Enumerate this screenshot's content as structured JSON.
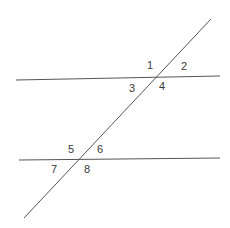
{
  "diagram": {
    "colors": {
      "line": "#555555",
      "label": "#3a3a3a",
      "background": "#ffffff"
    },
    "lines": [
      {
        "id": "parallel-line-top",
        "x1": 16,
        "y1": 80,
        "x2": 220,
        "y2": 76
      },
      {
        "id": "parallel-line-bottom",
        "x1": 19,
        "y1": 160,
        "x2": 220,
        "y2": 158
      },
      {
        "id": "transversal",
        "x1": 211,
        "y1": 19,
        "x2": 24,
        "y2": 218
      }
    ],
    "angle_labels": [
      {
        "text": "1",
        "x": 147,
        "y": 69
      },
      {
        "text": "2",
        "x": 181,
        "y": 70
      },
      {
        "text": "3",
        "x": 129,
        "y": 92
      },
      {
        "text": "4",
        "x": 159,
        "y": 90
      },
      {
        "text": "5",
        "x": 68,
        "y": 153
      },
      {
        "text": "6",
        "x": 97,
        "y": 153
      },
      {
        "text": "7",
        "x": 51,
        "y": 173
      },
      {
        "text": "8",
        "x": 84,
        "y": 173
      }
    ]
  }
}
